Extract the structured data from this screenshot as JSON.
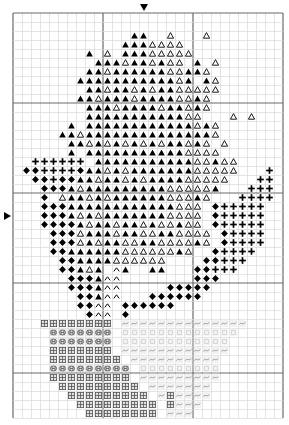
{
  "chart_data": {
    "type": "heatmap",
    "title": "",
    "subtitle": "",
    "xlabel": "",
    "ylabel": "",
    "grid": true,
    "legend_position": "none",
    "grid_columns": 30,
    "grid_rows": 45,
    "cell_size_px": 9,
    "origin_px": [
      13,
      13
    ],
    "axis_ranges": {
      "x": [
        0,
        30
      ],
      "y": [
        0,
        45
      ]
    },
    "center_markers": [
      {
        "name": "top-center-marker",
        "glyph": "down-triangle",
        "column": 14
      },
      {
        "name": "left-center-marker",
        "glyph": "right-triangle",
        "row": 22
      }
    ],
    "symbol_key": [
      {
        "id": "F",
        "name": "filled-triangle",
        "glyph": "▲",
        "color": "#000000",
        "fill": "solid"
      },
      {
        "id": "O",
        "name": "outline-triangle",
        "glyph": "△",
        "color": "#000000",
        "fill": "outline"
      },
      {
        "id": "P",
        "name": "plus-sign",
        "glyph": "+",
        "color": "#000000",
        "fill": "solid"
      },
      {
        "id": "D",
        "name": "filled-diamond",
        "glyph": "♦",
        "color": "#000000",
        "fill": "solid"
      },
      {
        "id": "C",
        "name": "caret-chevron",
        "glyph": "∧",
        "color": "#000000",
        "fill": "outline"
      },
      {
        "id": "H",
        "name": "hash-window",
        "glyph": "⊞",
        "color": "#555555",
        "fill": "outline"
      },
      {
        "id": "B",
        "name": "circle-h",
        "glyph": "Ⓗ",
        "color": "#555555",
        "fill": "outline"
      },
      {
        "id": "T",
        "name": "tilde-wave",
        "glyph": "~",
        "color": "#9a9a9a",
        "fill": "outline"
      },
      {
        "id": "S",
        "name": "light-dot",
        "glyph": "·",
        "color": "#c0c0c0",
        "fill": "outline"
      }
    ],
    "colors": {
      "background": "#ffffff",
      "grid_minor": "#d8d8d8",
      "grid_major": "#6a6a6a",
      "symbol_dark": "#000000",
      "symbol_mid": "#555555",
      "symbol_light": "#9a9a9a"
    },
    "rows": [
      "..............................",
      "..............................",
      ".............FF..O...O........",
      "............FFFOOOO...........",
      "........F.O.FFFOOOOO..........",
      ".........FFFOFFOFOO.F.O.......",
      "........FFOFFFFFFOOFFO........",
      ".......FFFFFFFFFFFOF.FO.......",
      "........FFOFFOFOFFOOOOO.......",
      ".......FFOFFFOFFFFOOFO........",
      "........FFFOFFFFOFFOFO........",
      "........FFFFFFFFFFFOO...O.O...",
      "......F.FFFFFFFFFFFFOFO.......",
      ".....FFOFFFFFFFFFFFFFFO.......",
      "......FFOFOFOFOFOFFOFO.O......",
      "......F.FFFFFFFFFFFOOOO.......",
      "..PPPPPP.FFFFFFFFFFFOOFOO.....",
      ".DDPPPPDFFOFOFFFFFFFOOOOO...P.",
      "..DDPDDFFOFFOFOFFFFOOOOO...PP.",
      "...DDDFOFFFFFFFFFOOOOOF...PPP.",
      "...D.OFFOFOFFFFFFOOOFO...PPPP.",
      "...DDDFFFFFFFFFFFFOOO.DPPPPP..",
      "...DDDFOFOFFFFFFFOOOO.DPPPPP..",
      "...DDDDFOFFOFFOFOOFOO.DPPPPP..",
      "....DDDOFFFOFFOOFFOOOO.DPPPP..",
      "....DDDOFOFFOOFFOOOOFO.DPPPP..",
      "....DDFFFFFFOOOOOOFO..DPPPP...",
      ".....DDFFFFOOOOOO....DDPPP....",
      ".....DDFOF.CF..FF...DDPPP.....",
      "......DDDFCC........DDD.......",
      "......DDDFCC.....DDDDD........",
      ".......DDFCC...DDDDDD.........",
      ".......DDCC.DDDDDD............",
      "........DCC.D.................",
      "...HHHHHHHH.TTTTTTTTTTTTTT....",
      "....BBBBBBB.SSSSSSSSSSSSS.....",
      "....BBBBBBB.SSSSSSSSSSSS......",
      "....HHHHHHH.TTTTTTTTTTTT......",
      "....HHHHHHHH.TTTTTTTTTT.......",
      "....BBBBBBBBB.SSSSSSSSS.......",
      "....HHHHHHHHH.TTTTTTTTT.......",
      ".....HHHHHHHHH.TTTTTTT........",
      "......HHHHHHHHH.THTTTT........",
      ".......HHHHHHHHH.HTTT.........",
      "........HHHHHHHH.TTT.........."
    ]
  }
}
